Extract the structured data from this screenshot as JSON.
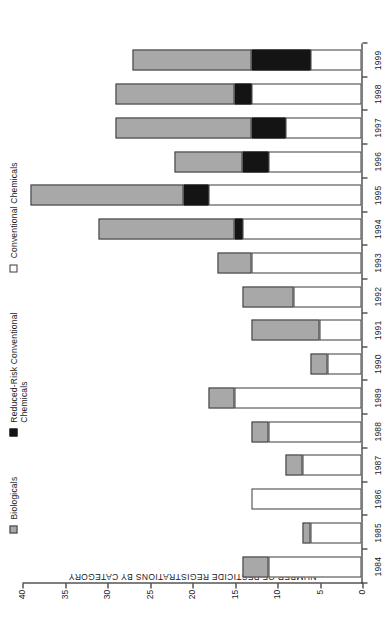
{
  "chart_data": {
    "type": "bar",
    "title": "",
    "subtitle": "",
    "xlabel": "",
    "ylabel": "NUMBER OF PESTICIDE REGISTRATIONS BY CATEGORY",
    "ylim": [
      0,
      40
    ],
    "yticks": [
      0,
      5,
      10,
      15,
      20,
      25,
      30,
      35,
      40
    ],
    "ytick_labels": [
      "0",
      "5",
      "10",
      "15",
      "20",
      "25",
      "30",
      "35",
      "40"
    ],
    "grid": false,
    "orientation": "horizontal-rotated",
    "stacked": true,
    "legend_position": "top-left",
    "categories": [
      "1984",
      "1985",
      "1986",
      "1987",
      "1988",
      "1989",
      "1990",
      "1991",
      "1992",
      "1993",
      "1994",
      "1995",
      "1996",
      "1997",
      "1998",
      "1999"
    ],
    "series": [
      {
        "name": "Conventional Chemicals",
        "color": "#ffffff",
        "values": [
          11,
          6,
          13,
          7,
          11,
          15,
          4,
          5,
          8,
          13,
          14,
          18,
          11,
          9,
          13,
          6
        ]
      },
      {
        "name": "Reduced-Risk Conventional Chemicals",
        "color": "#141414",
        "values": [
          0,
          0,
          0,
          0,
          0,
          0,
          0,
          0,
          0,
          0,
          1,
          3,
          3,
          4,
          2,
          7
        ]
      },
      {
        "name": "Biologicals",
        "color": "#a8a8a8",
        "values": [
          3,
          1,
          0,
          2,
          2,
          3,
          2,
          8,
          6,
          4,
          16,
          18,
          8,
          16,
          14,
          14
        ]
      }
    ],
    "totals": [
      14,
      7,
      13,
      9,
      13,
      18,
      6,
      13,
      14,
      17,
      31,
      39,
      22,
      29,
      29,
      27
    ]
  },
  "axis": {
    "value_axis_title": "NUMBER OF PESTICIDE REGISTRATIONS BY CATEGORY"
  },
  "legend": {
    "items": [
      {
        "label": "Biologicals",
        "swatch": "gray-swatch"
      },
      {
        "label": "Reduced-Risk Conventional\nChemicals",
        "swatch": "black-swatch"
      },
      {
        "label": "Conventional Chemicals",
        "swatch": "white-swatch"
      }
    ]
  }
}
